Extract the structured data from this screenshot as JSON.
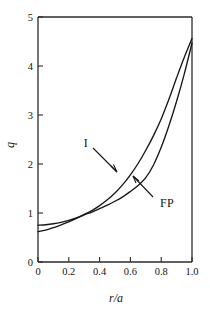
{
  "chart_data": {
    "type": "line",
    "title": "",
    "subtitle": "",
    "xlabel": "r/a",
    "ylabel": "q",
    "xlim": [
      0,
      1.0
    ],
    "ylim": [
      0,
      5
    ],
    "grid": false,
    "legend_position": "inline-annotations",
    "x_ticks": [
      0,
      0.2,
      0.4,
      0.6,
      0.8,
      1.0
    ],
    "x_tick_labels": [
      "0",
      "0.2",
      "0.4",
      "0.6",
      "0.8",
      "1.0"
    ],
    "y_ticks": [
      0,
      1,
      2,
      3,
      4,
      5
    ],
    "y_tick_labels": [
      "0",
      "1",
      "2",
      "3",
      "4",
      "5"
    ],
    "series": [
      {
        "name": "I",
        "label": "I",
        "x": [
          0.0,
          0.05,
          0.1,
          0.15,
          0.2,
          0.25,
          0.3,
          0.35,
          0.4,
          0.45,
          0.5,
          0.55,
          0.6,
          0.65,
          0.7,
          0.75,
          0.8,
          0.85,
          0.9,
          0.95,
          1.0
        ],
        "y": [
          0.75,
          0.76,
          0.78,
          0.81,
          0.85,
          0.9,
          0.97,
          1.05,
          1.15,
          1.27,
          1.41,
          1.58,
          1.78,
          2.01,
          2.28,
          2.58,
          2.92,
          3.32,
          3.76,
          4.18,
          4.56
        ]
      },
      {
        "name": "FP",
        "label": "FP",
        "x": [
          0.0,
          0.05,
          0.1,
          0.15,
          0.2,
          0.25,
          0.3,
          0.35,
          0.4,
          0.45,
          0.5,
          0.55,
          0.6,
          0.65,
          0.7,
          0.75,
          0.8,
          0.85,
          0.9,
          0.95,
          1.0
        ],
        "y": [
          0.62,
          0.65,
          0.7,
          0.76,
          0.82,
          0.89,
          0.96,
          1.02,
          1.09,
          1.16,
          1.24,
          1.33,
          1.44,
          1.56,
          1.72,
          1.98,
          2.34,
          2.78,
          3.28,
          3.84,
          4.47
        ]
      }
    ],
    "annotations": [
      {
        "text": "I",
        "x": 0.335,
        "y": 2.45,
        "points_to_series": "I"
      },
      {
        "text": "FP",
        "x": 0.775,
        "y": 1.13,
        "points_to_series": "FP"
      }
    ]
  }
}
